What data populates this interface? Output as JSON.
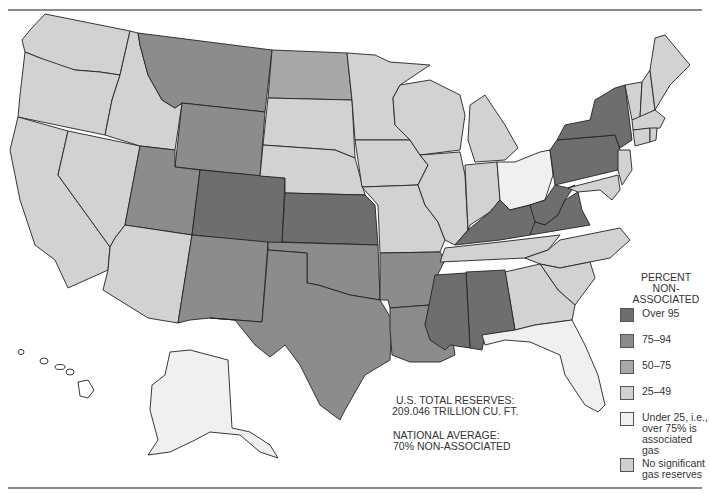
{
  "map": {
    "subject": "Percent of natural gas reserves that are non-associated, by U.S. state",
    "colors": {
      "over_95": "#6e6e6e",
      "75_94": "#8c8c8c",
      "50_75": "#a8a8a8",
      "25_49": "#d2d2d2",
      "under_25": "#f0f0f0",
      "no_significant": "#cfcfcf",
      "water": "#ffffff",
      "border": "#222222"
    },
    "states_by_category": {
      "over_95": [
        "New York",
        "Pennsylvania",
        "West Virginia",
        "Virginia",
        "Kentucky",
        "Colorado",
        "Kansas",
        "Mississippi",
        "Alabama"
      ],
      "75_94": [
        "Montana",
        "Wyoming",
        "Utah",
        "New Mexico",
        "Texas",
        "Oklahoma",
        "Arkansas",
        "Louisiana"
      ],
      "50_75": [
        "North Dakota"
      ],
      "under_25": [
        "Ohio",
        "Florida",
        "Alaska"
      ],
      "no_significant": [
        "Washington",
        "Oregon",
        "California",
        "Idaho",
        "Nevada",
        "Arizona",
        "South Dakota",
        "Nebraska",
        "Minnesota",
        "Iowa",
        "Missouri",
        "Wisconsin",
        "Illinois",
        "Michigan",
        "Indiana",
        "Tennessee",
        "North Carolina",
        "South Carolina",
        "Georgia",
        "Maine",
        "New Hampshire",
        "Vermont",
        "Massachusetts",
        "Connecticut",
        "Rhode Island",
        "New Jersey",
        "Delaware",
        "Maryland",
        "Hawaii"
      ]
    }
  },
  "notes": {
    "total_reserves_line1": "U.S. TOTAL RESERVES:",
    "total_reserves_line2": "209.046 TRILLION CU. FT.",
    "national_avg_line1": "NATIONAL AVERAGE:",
    "national_avg_line2": "70% NON-ASSOCIATED"
  },
  "legend": {
    "title_line1": "PERCENT",
    "title_line2": "NON-ASSOCIATED",
    "items": [
      {
        "label": "Over 95",
        "color": "#6e6e6e"
      },
      {
        "label": "75–94",
        "color": "#8c8c8c"
      },
      {
        "label": "50–75",
        "color": "#a8a8a8"
      },
      {
        "label": "25–49",
        "color": "#d2d2d2"
      },
      {
        "label": "Under 25, i.e.,\nover 75% is\nassociated gas",
        "color": "#f0f0f0"
      },
      {
        "label": "No significant\ngas reserves",
        "color": "#cfcfcf"
      }
    ]
  }
}
